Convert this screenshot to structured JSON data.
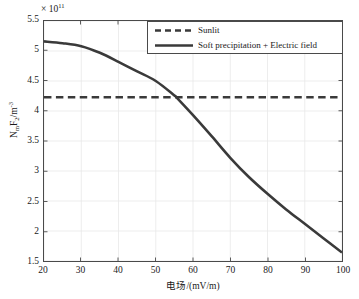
{
  "chart_data": {
    "type": "line",
    "title": "",
    "xlabel": "电场/(mV/m)",
    "ylabel": "NmF2/m-3",
    "ylabel_parts": {
      "prefix": "N",
      "sub1": "m",
      "mid": "F",
      "sub2": "2",
      "unit": "/m",
      "sup": "-3"
    },
    "y_multiplier_text": "× 10",
    "y_multiplier_exponent": "11",
    "y_multiplier_value": 100000000000.0,
    "xlim": [
      20,
      100
    ],
    "ylim": [
      1.5,
      5.5
    ],
    "xticks": [
      20,
      30,
      40,
      50,
      60,
      70,
      80,
      90,
      100
    ],
    "yticks": [
      1.5,
      2,
      2.5,
      3,
      3.5,
      4,
      4.5,
      5,
      5.5
    ],
    "ytick_labels": [
      "1.5",
      "2",
      "2.5",
      "3",
      "3.5",
      "4",
      "4.5",
      "5",
      "5.5"
    ],
    "xtick_labels": [
      "20",
      "30",
      "40",
      "50",
      "60",
      "70",
      "80",
      "90",
      "100"
    ],
    "grid": true,
    "legend_position": "top-right",
    "series": [
      {
        "name": "Sunlit",
        "style": "dashed",
        "color": "#3a3a3a",
        "x": [
          20,
          100
        ],
        "values": [
          4.23,
          4.23
        ]
      },
      {
        "name": "Soft precipitation + Electric field",
        "style": "solid",
        "color": "#3a3a3a",
        "x": [
          20,
          25,
          30,
          35,
          40,
          45,
          50,
          55,
          55.5,
          60,
          65,
          70,
          75,
          80,
          85,
          90,
          95,
          100
        ],
        "values": [
          5.16,
          5.13,
          5.08,
          4.97,
          4.82,
          4.66,
          4.5,
          4.26,
          4.23,
          3.93,
          3.58,
          3.22,
          2.9,
          2.62,
          2.36,
          2.12,
          1.88,
          1.64
        ]
      }
    ],
    "annotations": {
      "intersection_x": 55.5,
      "intersection_y": 4.23
    }
  },
  "legend": {
    "items": [
      {
        "label": "Sunlit",
        "style": "dashed"
      },
      {
        "label": "Soft precipitation + Electric field",
        "style": "solid"
      }
    ]
  },
  "colors": {
    "line": "#3a3a3a",
    "grid": "#e8e8e8",
    "axis": "#4a4a4a",
    "background": "#ffffff"
  }
}
